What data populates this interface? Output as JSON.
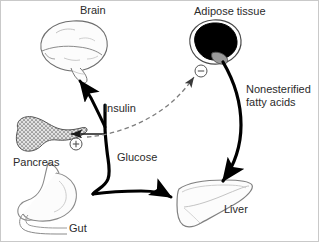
{
  "figure": {
    "type": "biological-flow-diagram",
    "background_color": "#ffffff",
    "border_color": "#c9c9c9"
  },
  "organs": [
    {
      "id": "brain",
      "label": "Brain",
      "icon": "brain-icon",
      "label_x": 79,
      "label_y": 4,
      "fill": "#fdfdfd",
      "stroke": "#6e6e6e"
    },
    {
      "id": "adipose",
      "label": "Adipose tissue",
      "icon": "adipose-tissue-icon",
      "label_x": 193,
      "label_y": 5,
      "fill": "#000000",
      "stroke": "#4a4a4a",
      "accent_fill": "#9a9a9a"
    },
    {
      "id": "pancreas",
      "label": "Pancreas",
      "icon": "pancreas-icon",
      "label_x": 12,
      "label_y": 156,
      "fill": "#d8d8d8",
      "stroke": "#555555"
    },
    {
      "id": "gut",
      "label": "Gut",
      "icon": "gut-stomach-icon",
      "label_x": 68,
      "label_y": 222,
      "fill": "#fcfcfc",
      "stroke": "#8a8a8a"
    },
    {
      "id": "liver",
      "label": "Liver",
      "icon": "liver-icon",
      "label_x": 223,
      "label_y": 203,
      "fill": "#fcfcfc",
      "stroke": "#808080"
    }
  ],
  "pathways": [
    {
      "id": "insulin",
      "label": "Insulin",
      "style": "dashed",
      "color": "#7d7d7d",
      "from": "pancreas",
      "to": "adipose",
      "label_x": 103,
      "label_y": 103
    },
    {
      "id": "glucose",
      "label": "Glucose",
      "style": "solid-thick",
      "color": "#000000",
      "from": "gut",
      "to": "liver",
      "label_x": 116,
      "label_y": 152
    },
    {
      "id": "nonesterified-fatty-acids",
      "label": "Nonesterified\nfatty acids",
      "label_line1": "Nonesterified",
      "label_line2": "fatty acids",
      "style": "solid-thick-curved",
      "color": "#000000",
      "from": "adipose",
      "to": "liver",
      "label_x": 245,
      "label_y": 84
    }
  ],
  "markers": [
    {
      "id": "inhibition",
      "symbol": "−",
      "name": "minus-sign-circle",
      "target": "adipose",
      "x": 200,
      "y": 70,
      "radius": 6,
      "stroke": "#555555"
    },
    {
      "id": "stimulation",
      "symbol": "+",
      "name": "plus-sign-circle",
      "target": "pancreas",
      "x": 75,
      "y": 143,
      "radius": 6,
      "stroke": "#555555"
    }
  ],
  "arrows": [
    {
      "id": "glucose-to-brain",
      "from": "glucose-trunk",
      "to": "brain",
      "style": "solid-thick"
    },
    {
      "id": "glucose-to-pancreas",
      "from": "glucose-trunk",
      "to": "pancreas",
      "style": "solid-thin"
    },
    {
      "id": "glucose-to-liver",
      "from": "glucose-trunk",
      "to": "liver",
      "style": "solid-thick"
    },
    {
      "id": "insulin-to-adipose",
      "from": "pancreas",
      "to": "adipose",
      "style": "dashed"
    },
    {
      "id": "nefa-to-liver",
      "from": "adipose",
      "to": "liver",
      "style": "solid-thick-curved"
    }
  ]
}
